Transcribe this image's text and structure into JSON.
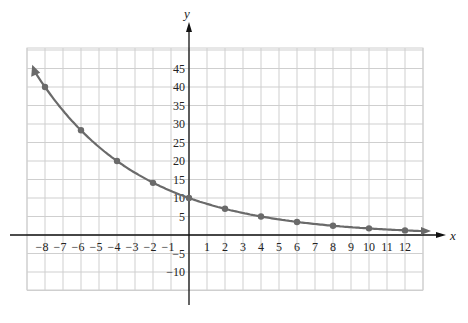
{
  "chart_data": {
    "type": "line",
    "title": "",
    "xlabel": "x",
    "ylabel": "y",
    "xlim": [
      -8.5,
      12.5
    ],
    "ylim": [
      -15,
      48
    ],
    "grid": true,
    "x_ticks": [
      -8,
      -7,
      -6,
      -5,
      -4,
      -3,
      -2,
      -1,
      1,
      2,
      3,
      4,
      5,
      6,
      7,
      8,
      9,
      10,
      11,
      12
    ],
    "y_ticks": [
      -10,
      -5,
      5,
      10,
      15,
      20,
      25,
      30,
      35,
      40,
      45
    ],
    "series": [
      {
        "name": "y = 10(1/2)^(x/4)",
        "function": "10*0.5^(x/4)",
        "x": [
          -8,
          -6,
          -4,
          -2,
          0,
          2,
          4,
          6,
          8,
          10,
          12
        ],
        "y": [
          40,
          28.3,
          20,
          14.1,
          10,
          7.1,
          5,
          3.5,
          2.5,
          1.8,
          1.25
        ],
        "color": "#6a6a6a",
        "arrows_both_ends": true
      }
    ]
  },
  "colors": {
    "curve": "#6a6a6a",
    "grid": "#cfcfcf",
    "axis": "#111111"
  }
}
